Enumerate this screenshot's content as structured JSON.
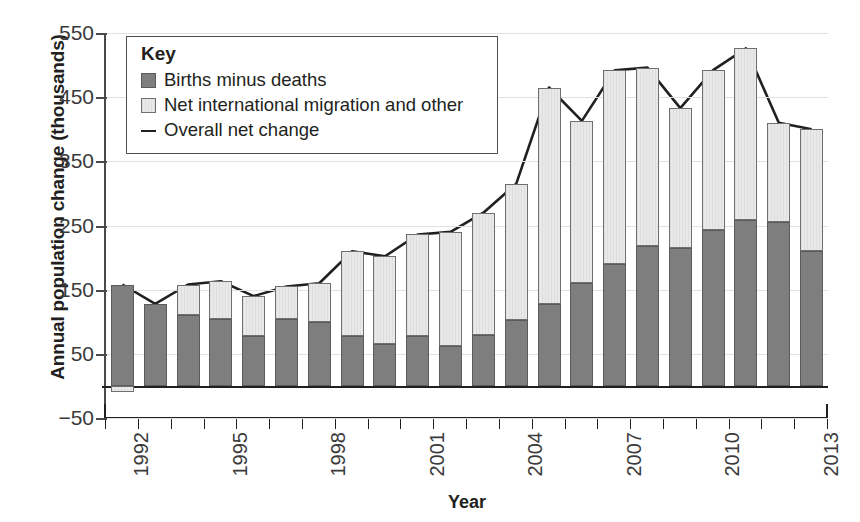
{
  "chart_data": {
    "type": "bar",
    "title": "",
    "xlabel": "Year",
    "ylabel": "Annual population change (thousands)",
    "ylim": [
      -50,
      550
    ],
    "yticks": [
      550,
      450,
      350,
      250,
      150,
      50,
      -50
    ],
    "grid": true,
    "legend_position": "top-left",
    "legend_title": "Key",
    "categories": [
      "1992",
      "1993",
      "1994",
      "1995",
      "1996",
      "1997",
      "1998",
      "1999",
      "2000",
      "2001",
      "2002",
      "2003",
      "2004",
      "2005",
      "2006",
      "2007",
      "2008",
      "2009",
      "2010",
      "2011",
      "2012",
      "2013"
    ],
    "xtick_labels": [
      "1992",
      "1995",
      "1998",
      "2001",
      "2004",
      "2007",
      "2010",
      "2013"
    ],
    "series": [
      {
        "name": "Births minus deaths",
        "type": "bar",
        "stacked": true,
        "color": "#7e7e7e",
        "values": [
          158,
          128,
          110,
          105,
          78,
          105,
          100,
          78,
          65,
          78,
          62,
          80,
          102,
          128,
          160,
          190,
          218,
          215,
          243,
          258,
          255,
          210
        ]
      },
      {
        "name": "Net international migration and other",
        "type": "bar",
        "stacked": true,
        "color": "#e4e4e4",
        "values": [
          -10,
          0,
          48,
          58,
          62,
          50,
          60,
          132,
          137,
          158,
          178,
          190,
          213,
          337,
          253,
          302,
          278,
          218,
          249,
          268,
          155,
          190
        ]
      },
      {
        "name": "Overall net change",
        "type": "line",
        "color": "#231f20",
        "values": [
          158,
          128,
          158,
          163,
          140,
          155,
          160,
          210,
          202,
          236,
          240,
          270,
          315,
          465,
          413,
          492,
          496,
          433,
          492,
          526,
          410,
          400
        ]
      }
    ]
  },
  "axis": {
    "ylabel": "Annual population change (thousands)",
    "xlabel": "Year"
  },
  "legend": {
    "title": "Key",
    "items": [
      {
        "label": "Births minus deaths",
        "icon": "filled-square-dark-icon"
      },
      {
        "label": "Net international migration and other",
        "icon": "filled-square-light-icon"
      },
      {
        "label": "Overall net change",
        "icon": "line-segment-icon"
      }
    ]
  }
}
